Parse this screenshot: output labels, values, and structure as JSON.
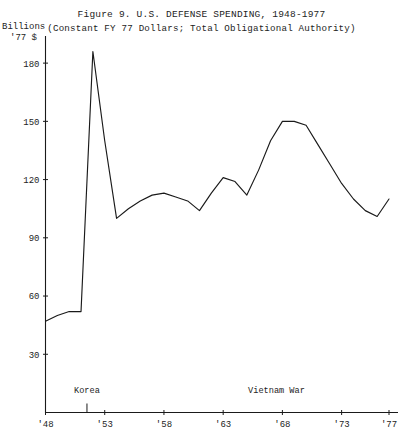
{
  "figure": {
    "title": "Figure 9.  U.S. DEFENSE SPENDING, 1948-1977",
    "subtitle": "(Constant FY 77 Dollars; Total Obligational Authority)",
    "y_axis_title_line1": "Billions",
    "y_axis_title_line2": "'77 $"
  },
  "chart_data": {
    "type": "line",
    "title": "Figure 9.  U.S. DEFENSE SPENDING, 1948-1977",
    "subtitle": "(Constant FY 77 Dollars; Total Obligational Authority)",
    "xlabel": "",
    "ylabel": "Billions '77 $",
    "xlim": [
      1948,
      1977
    ],
    "ylim": [
      0,
      195
    ],
    "yticks": [
      30,
      60,
      90,
      120,
      150,
      180
    ],
    "ytick_labels": [
      "30",
      "60",
      "90",
      "120",
      "150",
      "180"
    ],
    "xticks": [
      1948,
      1953,
      1958,
      1963,
      1968,
      1973,
      1977
    ],
    "xtick_labels": [
      "'48",
      "'53",
      "'58",
      "'63",
      "'68",
      "'73",
      "'77"
    ],
    "grid": false,
    "legend": "none",
    "line_color": "#1a1a1a",
    "x": [
      1948,
      1949,
      1950,
      1951,
      1952,
      1953,
      1954,
      1955,
      1956,
      1957,
      1958,
      1959,
      1960,
      1961,
      1962,
      1963,
      1964,
      1965,
      1966,
      1967,
      1968,
      1969,
      1970,
      1971,
      1972,
      1973,
      1974,
      1975,
      1976,
      1977
    ],
    "values": [
      47,
      50,
      52,
      52,
      186,
      140,
      100,
      105,
      109,
      112,
      113,
      111,
      109,
      104,
      113,
      121,
      119,
      112,
      125,
      140,
      150,
      150,
      148,
      138,
      128,
      118,
      110,
      104,
      101,
      110
    ],
    "annotations": [
      {
        "label": "Korea",
        "x": 1951.5,
        "note": "axis marker tick below label"
      },
      {
        "label": "Vietnam War",
        "x": 1967.5,
        "note": "axis region label"
      }
    ]
  }
}
